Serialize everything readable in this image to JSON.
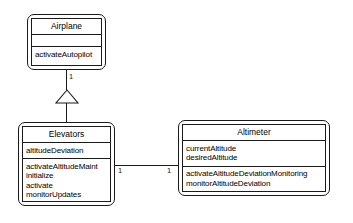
{
  "diagram": {
    "type": "uml-class-diagram",
    "background_color": "#ffffff",
    "line_color": "#1a1a1a",
    "classes": [
      {
        "id": "airplane",
        "name": "Airplane",
        "attributes": [],
        "operations": [
          "activateAutopilot"
        ]
      },
      {
        "id": "elevators",
        "name": "Elevators",
        "attributes": [
          "altitudeDeviation"
        ],
        "operations": [
          "activateAltitudeMaint",
          "initialize",
          "activate",
          "monitorUpdates"
        ]
      },
      {
        "id": "altimeter",
        "name": "Altimeter",
        "attributes": [
          "currentAltitude",
          "desiredAltitude"
        ],
        "operations": [
          "activateAltitudeDeviationMonitoring",
          "monitorAltitudeDeviation"
        ]
      }
    ],
    "relationships": [
      {
        "id": "generalization-elevators-airplane",
        "kind": "generalization",
        "from": "Elevators",
        "to": "Airplane",
        "source_multiplicity": "",
        "target_multiplicity": "1"
      },
      {
        "id": "association-elevators-altimeter",
        "kind": "association",
        "from": "Elevators",
        "to": "Altimeter",
        "source_multiplicity": "1",
        "target_multiplicity": "1"
      }
    ]
  }
}
